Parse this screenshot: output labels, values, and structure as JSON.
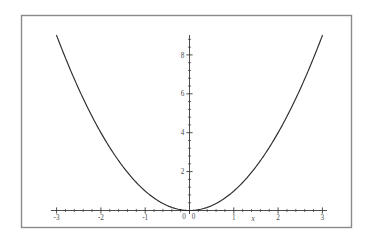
{
  "figure": {
    "background_color": "#ffffff",
    "frame_color": "#8a8a8a",
    "axis_color": "#3a3a3a",
    "curve_color": "#2b2b2b",
    "label_color": "#4a4a4a"
  },
  "chart_data": {
    "type": "line",
    "title": "",
    "subtitle": "",
    "xlabel": "x",
    "ylabel": "",
    "function": "y = x^2",
    "grid": false,
    "legend": null,
    "legend_position": "none",
    "xlim": [
      -3.35,
      3.35
    ],
    "ylim": [
      -0.45,
      9.6
    ],
    "x_major_ticks": [
      -3,
      -2,
      -1,
      0,
      1,
      2,
      3
    ],
    "x_major_tick_labels": [
      "-3",
      "-2",
      "-1",
      "0",
      "1",
      "2",
      "3"
    ],
    "x_minor_tick_step": 0.2,
    "y_major_ticks": [
      2,
      4,
      6,
      8
    ],
    "y_major_tick_labels": [
      "2",
      "4",
      "6",
      "8"
    ],
    "y_origin_label": "0",
    "y_minor_tick_step": 0.4,
    "series": [
      {
        "name": "x^2",
        "x": [
          -3,
          -2.8,
          -2.6,
          -2.4,
          -2.2,
          -2,
          -1.8,
          -1.6,
          -1.4,
          -1.2,
          -1,
          -0.8,
          -0.6,
          -0.4,
          -0.2,
          0,
          0.2,
          0.4,
          0.6,
          0.8,
          1,
          1.2,
          1.4,
          1.6,
          1.8,
          2,
          2.2,
          2.4,
          2.6,
          2.8,
          3
        ],
        "y": [
          9,
          7.84,
          6.76,
          5.76,
          4.84,
          4,
          3.24,
          2.56,
          1.96,
          1.44,
          1,
          0.64,
          0.36,
          0.16,
          0.04,
          0,
          0.04,
          0.16,
          0.36,
          0.64,
          1,
          1.44,
          1.96,
          2.56,
          3.24,
          4,
          4.84,
          5.76,
          6.76,
          7.84,
          9
        ]
      }
    ],
    "annotations": [
      {
        "text": "x",
        "role": "x-axis-name"
      },
      {
        "text": "0",
        "role": "x-origin-label"
      },
      {
        "text": "0",
        "role": "y-origin-label"
      }
    ]
  }
}
